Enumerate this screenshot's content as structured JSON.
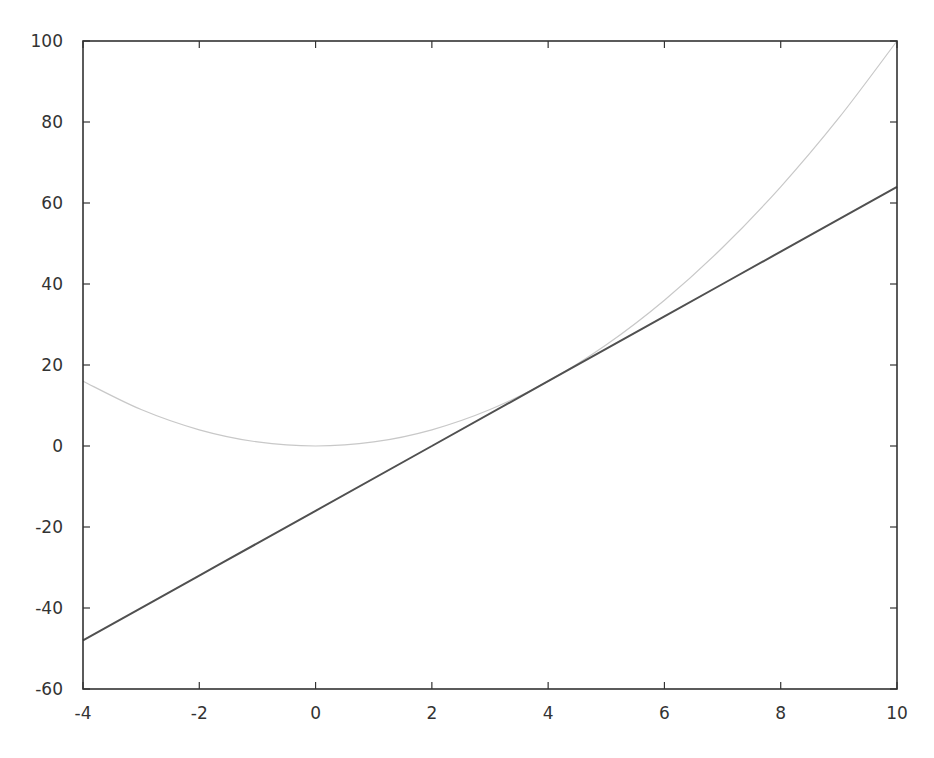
{
  "chart_data": {
    "type": "line",
    "title": "",
    "xlabel": "",
    "ylabel": "",
    "xlim": [
      -4,
      10
    ],
    "ylim": [
      -60,
      100
    ],
    "grid": false,
    "legend": null,
    "x_ticks": [
      -4,
      -2,
      0,
      2,
      4,
      6,
      8,
      10
    ],
    "y_ticks": [
      -60,
      -40,
      -20,
      0,
      20,
      40,
      60,
      80,
      100
    ],
    "x_tick_labels": [
      "-4",
      "-2",
      "0",
      "2",
      "4",
      "6",
      "8",
      "10"
    ],
    "y_tick_labels": [
      "-60",
      "-40",
      "-20",
      "0",
      "20",
      "40",
      "60",
      "80",
      "100"
    ],
    "series": [
      {
        "name": "parabola",
        "expression": "x^2",
        "color": "#c8c8c8",
        "x": [
          -4,
          -3,
          -2,
          -1,
          0,
          1,
          2,
          3,
          4,
          5,
          6,
          7,
          8,
          9,
          10
        ],
        "values": [
          16,
          9,
          4,
          1,
          0,
          1,
          4,
          9,
          16,
          25,
          36,
          49,
          64,
          81,
          100
        ]
      },
      {
        "name": "tangent-line",
        "expression": "8x - 16",
        "color": "#505050",
        "x": [
          -4,
          -2,
          0,
          2,
          4,
          6,
          8,
          10
        ],
        "values": [
          -48,
          -32,
          -16,
          0,
          16,
          32,
          48,
          64
        ]
      }
    ],
    "layout": {
      "plot_left": 83,
      "plot_right": 897,
      "plot_top": 41,
      "plot_bottom": 689,
      "frame_color": "#333333"
    }
  }
}
